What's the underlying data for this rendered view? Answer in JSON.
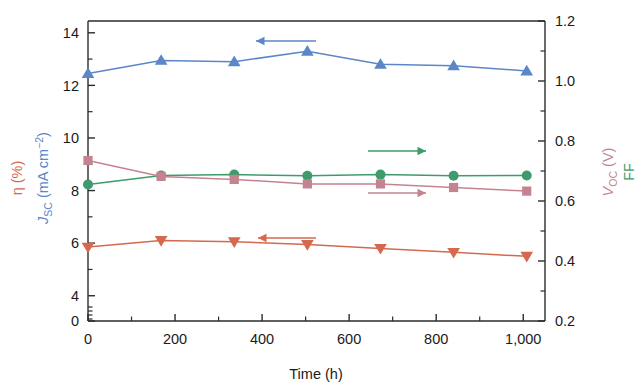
{
  "chart_data": {
    "type": "line",
    "title": "",
    "xlabel": "Time (h)",
    "xlim": [
      0,
      1050
    ],
    "xticks": [
      0,
      200,
      400,
      600,
      800,
      1000
    ],
    "xticklabels": [
      "0",
      "200",
      "400",
      "600",
      "800",
      "1,000"
    ],
    "x_minor_step": 100,
    "grid": false,
    "legend": "none (inline colour-coded arrows point to the owning axis)",
    "left_axis": {
      "labels": [
        "η (%)",
        "J_SC (mA cm−2)"
      ],
      "eta_label": "η (%)",
      "jsc_label_main": "J",
      "jsc_label_sub": "SC",
      "jsc_label_unit": " (mA cm",
      "jsc_label_sup": "−2",
      "jsc_label_close": ")",
      "ticks": [
        0,
        4,
        6,
        8,
        10,
        12,
        14
      ],
      "ticklabels": [
        "0",
        "4",
        "6",
        "8",
        "10",
        "12",
        "14"
      ],
      "broken": true,
      "note": "axis is broken between 0 and 4 (no 2 tick)",
      "minor_ticks": [
        5,
        7,
        9,
        11,
        13,
        15
      ],
      "color_eta": "#d4694f",
      "color_jsc": "#5b86c8"
    },
    "right_axis": {
      "voc_label_main": "V",
      "voc_label_sub": "OC",
      "voc_label_unit": " (V)",
      "ff_label": "FF",
      "ticks": [
        0.2,
        0.4,
        0.6,
        0.8,
        1.0,
        1.2
      ],
      "ticklabels": [
        "0.2",
        "0.4",
        "0.6",
        "0.8",
        "1.0",
        "1.2"
      ],
      "minor_ticks": [
        0.3,
        0.5,
        0.7,
        0.9,
        1.1
      ],
      "color_voc": "#c4848f",
      "color_ff": "#3f9b6d"
    },
    "x": [
      0,
      168,
      336,
      504,
      672,
      840,
      1008
    ],
    "series": [
      {
        "name": "J_SC (mA cm−2)",
        "axis": "left",
        "marker": "triangle-up",
        "color": "#5b86c8",
        "values": [
          12.45,
          12.95,
          12.9,
          13.3,
          12.8,
          12.75,
          12.55
        ],
        "arrow": "left"
      },
      {
        "name": "FF",
        "axis": "right",
        "marker": "circle",
        "color": "#3f9b6d",
        "values": [
          0.655,
          0.685,
          0.688,
          0.684,
          0.688,
          0.684,
          0.685
        ],
        "arrow": "right"
      },
      {
        "name": "V_OC (V)",
        "axis": "right",
        "marker": "square",
        "color": "#c4848f",
        "values": [
          0.735,
          0.682,
          0.672,
          0.657,
          0.657,
          0.645,
          0.633
        ],
        "arrow": "right"
      },
      {
        "name": "η (%)",
        "axis": "left",
        "marker": "triangle-down",
        "color": "#d4694f",
        "values": [
          5.85,
          6.1,
          6.05,
          5.95,
          5.8,
          5.65,
          5.5
        ],
        "arrow": "left"
      }
    ],
    "annotations": [
      {
        "name": "jsc-arrow",
        "direction": "left",
        "color": "#5b86c8",
        "points_to": "left axis"
      },
      {
        "name": "ff-arrow",
        "direction": "right",
        "color": "#3f9b6d",
        "points_to": "right axis"
      },
      {
        "name": "voc-arrow",
        "direction": "right",
        "color": "#c4848f",
        "points_to": "right axis"
      },
      {
        "name": "eta-arrow",
        "direction": "left",
        "color": "#d4694f",
        "points_to": "left axis"
      }
    ]
  }
}
